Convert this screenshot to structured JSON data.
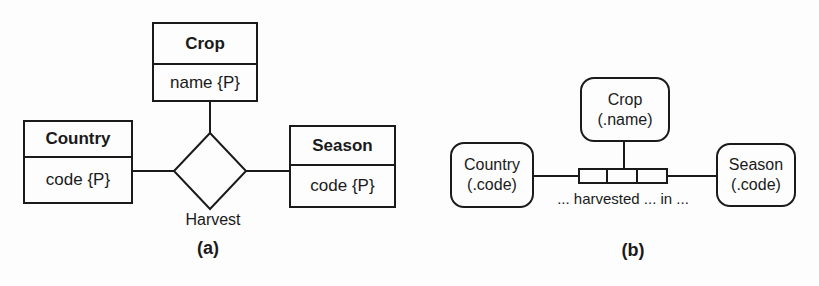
{
  "figure": {
    "diagram_a": {
      "caption": "(a)",
      "entities": {
        "crop": {
          "name": "Crop",
          "attribute": "name {P}"
        },
        "country": {
          "name": "Country",
          "attribute": "code {P}"
        },
        "season": {
          "name": "Season",
          "attribute": "code {P}"
        }
      },
      "relationship": {
        "label": "Harvest"
      }
    },
    "diagram_b": {
      "caption": "(b)",
      "objects": {
        "crop": {
          "name": "Crop",
          "ref": "(.name)"
        },
        "country": {
          "name": "Country",
          "ref": "(.code)"
        },
        "season": {
          "name": "Season",
          "ref": "(.code)"
        }
      },
      "predicate": {
        "reading": "... harvested ... in ..."
      }
    },
    "colors": {
      "line": "#1a1a1a",
      "background": "#ffffff"
    }
  }
}
